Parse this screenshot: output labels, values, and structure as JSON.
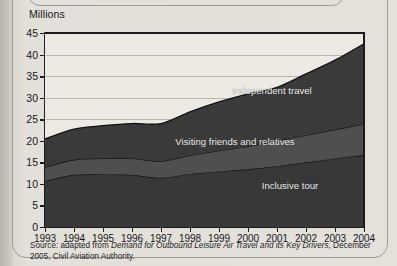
{
  "figure": {
    "axis_unit_label": "Millions",
    "source_prefix": "Source: adapted from ",
    "source_title": "Demand for Outbound Leisure Air Travel and its Key Drivers",
    "source_suffix": ", December 2005, Civil Aviation Authority."
  },
  "colors": {
    "inclusive_tour": "#383838",
    "visiting_friends": "#4f4f4f",
    "independent_travel": "#3a3a3a",
    "plot_background": "#eceae2",
    "gridline": "#b9b7af",
    "axis": "#1b1b1d",
    "label_text": "#f2f1ee"
  },
  "chart_data": {
    "type": "area",
    "title": "",
    "subtitle": "",
    "xlabel": "",
    "ylabel": "Millions",
    "ylim": [
      0,
      45
    ],
    "xlim": [
      1993,
      2004
    ],
    "yticks": [
      0,
      5,
      10,
      15,
      20,
      25,
      30,
      35,
      40,
      45
    ],
    "grid": true,
    "stacked": true,
    "legend": "inline-labels",
    "categories": [
      1993,
      1994,
      1995,
      1996,
      1997,
      1998,
      1999,
      2000,
      2001,
      2002,
      2003,
      2004
    ],
    "x_tick_labels": [
      "1993",
      "1994",
      "1995",
      "1996",
      "1997",
      "1998",
      "1999",
      "2000",
      "2001",
      "2002",
      "2003",
      "2004"
    ],
    "series": [
      {
        "name": "Inclusive tour",
        "values": [
          10.7,
          12.1,
          12.2,
          12.1,
          11.4,
          12.3,
          12.9,
          13.4,
          14.1,
          15.0,
          15.9,
          16.7
        ]
      },
      {
        "name": "Visiting friends and relatives",
        "values": [
          3.2,
          3.5,
          3.7,
          3.8,
          3.9,
          4.3,
          4.8,
          5.3,
          5.9,
          6.3,
          6.7,
          7.2
        ]
      },
      {
        "name": "Independent travel",
        "values": [
          6.5,
          7.1,
          7.6,
          8.1,
          8.7,
          10.1,
          11.3,
          12.2,
          12.4,
          14.2,
          16.1,
          18.6
        ]
      }
    ],
    "cumulative_tops": {
      "inclusive_tour": [
        10.7,
        12.1,
        12.2,
        12.1,
        11.4,
        12.3,
        12.9,
        13.4,
        14.1,
        15.0,
        15.9,
        16.7
      ],
      "visiting_friends": [
        13.9,
        15.6,
        15.9,
        15.9,
        15.3,
        16.6,
        17.7,
        18.7,
        20.0,
        21.3,
        22.6,
        23.9
      ],
      "total": [
        20.4,
        22.7,
        23.5,
        24.0,
        24.0,
        26.7,
        29.0,
        30.9,
        32.4,
        35.5,
        38.7,
        42.5
      ]
    },
    "annotations": [
      {
        "text": "Independent travel",
        "series": "Independent travel"
      },
      {
        "text": "Visiting friends and relatives",
        "series": "Visiting friends and relatives"
      },
      {
        "text": "Inclusive tour",
        "series": "Inclusive tour"
      }
    ]
  }
}
